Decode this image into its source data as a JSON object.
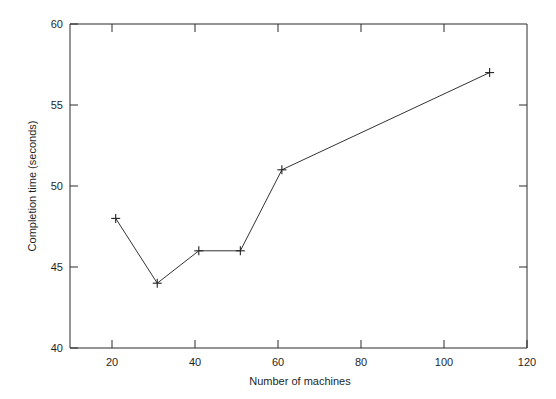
{
  "chart_data": {
    "type": "line",
    "title": "",
    "subtitle": "",
    "xlabel": "Number of machines",
    "ylabel": "Completion time (seconds)",
    "xlim": [
      10,
      120
    ],
    "ylim": [
      40,
      60
    ],
    "grid": false,
    "legend": false,
    "legend_position": "none",
    "marker": "plus",
    "line_color": "#333333",
    "background_color": "#ffffff",
    "axis_color": "#2b2b2b",
    "x": [
      21,
      31,
      41,
      51,
      61,
      111
    ],
    "values": [
      48,
      44,
      46,
      46,
      51,
      57
    ],
    "series": [
      {
        "name": "Completion time",
        "x": [
          21,
          31,
          41,
          51,
          61,
          111
        ],
        "values": [
          48,
          44,
          46,
          46,
          51,
          57
        ]
      }
    ],
    "points": [
      {
        "x": 21,
        "y": 48
      },
      {
        "x": 31,
        "y": 44
      },
      {
        "x": 41,
        "y": 46
      },
      {
        "x": 51,
        "y": 46
      },
      {
        "x": 61,
        "y": 51
      },
      {
        "x": 111,
        "y": 57
      }
    ],
    "xticks": [
      20,
      40,
      60,
      80,
      100,
      120
    ],
    "xtick_labels": [
      "20",
      "40",
      "60",
      "80",
      "100",
      "120"
    ],
    "yticks": [
      40,
      45,
      50,
      55,
      60
    ],
    "ytick_labels": [
      "40",
      "45",
      "50",
      "55",
      "60"
    ],
    "annotations": []
  },
  "axes": {
    "x_tick_labels": [
      "20",
      "40",
      "60",
      "80",
      "100",
      "120"
    ],
    "y_tick_labels": [
      "40",
      "45",
      "50",
      "55",
      "60"
    ],
    "x_axis_title": "Number of machines",
    "y_axis_title": "Completion time (seconds)"
  }
}
